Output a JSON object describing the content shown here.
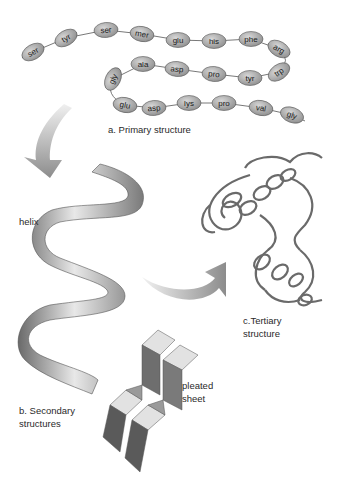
{
  "figure": {
    "primary": {
      "label": "a. Primary structure",
      "chain": [
        {
          "name": "ser",
          "x": 33,
          "y": 52,
          "rot": -30
        },
        {
          "name": "tyr",
          "x": 66,
          "y": 38,
          "rot": -30
        },
        {
          "name": "ser",
          "x": 106,
          "y": 30,
          "rot": -5
        },
        {
          "name": "mer",
          "x": 142,
          "y": 34,
          "rot": 10
        },
        {
          "name": "glu",
          "x": 178,
          "y": 40,
          "rot": 0
        },
        {
          "name": "his",
          "x": 214,
          "y": 41,
          "rot": 0
        },
        {
          "name": "phe",
          "x": 251,
          "y": 39,
          "rot": 0
        },
        {
          "name": "arg",
          "x": 279,
          "y": 49,
          "rot": 30
        },
        {
          "name": "trp",
          "x": 279,
          "y": 72,
          "rot": -35
        },
        {
          "name": "tyr",
          "x": 250,
          "y": 78,
          "rot": 0
        },
        {
          "name": "pro",
          "x": 214,
          "y": 74,
          "rot": 5
        },
        {
          "name": "asp",
          "x": 177,
          "y": 69,
          "rot": 5
        },
        {
          "name": "ala",
          "x": 143,
          "y": 64,
          "rot": 0
        },
        {
          "name": "gly",
          "x": 113,
          "y": 79,
          "rot": -65
        },
        {
          "name": "glu",
          "x": 125,
          "y": 105,
          "rot": 10
        },
        {
          "name": "asp",
          "x": 154,
          "y": 108,
          "rot": -5
        },
        {
          "name": "lys",
          "x": 189,
          "y": 103,
          "rot": 0
        },
        {
          "name": "pro",
          "x": 224,
          "y": 103,
          "rot": 0
        },
        {
          "name": "val",
          "x": 261,
          "y": 108,
          "rot": 10
        },
        {
          "name": "gly",
          "x": 292,
          "y": 115,
          "rot": 20
        }
      ]
    },
    "secondary": {
      "helix_label": "helix",
      "sheet_label_line1": "pleated",
      "sheet_label_line2": "sheet",
      "label_line1": "b. Secondary",
      "label_line2": "structures"
    },
    "tertiary": {
      "label_line1": "c.Tertiary",
      "label_line2": "structure"
    },
    "colors": {
      "bead_fill": "#a8a8a8",
      "bead_stroke": "#555555",
      "arrow": "#9a9a9a",
      "ribbon_dark": "#6e6e6e",
      "ribbon_light": "#e6e6e6"
    }
  }
}
